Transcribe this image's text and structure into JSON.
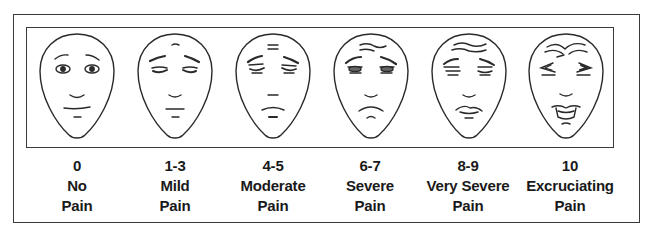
{
  "scale": {
    "title": "",
    "levels": [
      {
        "score": "0",
        "line1": "No",
        "line2": "Pain",
        "face_icon": "no-pain-face-icon"
      },
      {
        "score": "1-3",
        "line1": "Mild",
        "line2": "Pain",
        "face_icon": "mild-pain-face-icon"
      },
      {
        "score": "4-5",
        "line1": "Moderate",
        "line2": "Pain",
        "face_icon": "moderate-pain-face-icon"
      },
      {
        "score": "6-7",
        "line1": "Severe",
        "line2": "Pain",
        "face_icon": "severe-pain-face-icon"
      },
      {
        "score": "8-9",
        "line1": "Very Severe",
        "line2": "Pain",
        "face_icon": "very-severe-pain-face-icon"
      },
      {
        "score": "10",
        "line1": "Excruciating",
        "line2": "Pain",
        "face_icon": "excruciating-pain-face-icon"
      }
    ]
  },
  "colors": {
    "line": "#2a2a2a",
    "background": "#ffffff",
    "text": "#1a1a1a"
  }
}
